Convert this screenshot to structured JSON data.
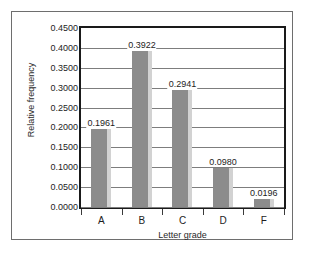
{
  "chart_data": {
    "type": "bar",
    "title": "",
    "xlabel": "Letter grade",
    "ylabel": "Relative frequency",
    "categories": [
      "A",
      "B",
      "C",
      "D",
      "F"
    ],
    "values": [
      0.1961,
      0.3922,
      0.2941,
      0.098,
      0.0196
    ],
    "data_labels": [
      "0.1961",
      "0.3922",
      "0.2941",
      "0.0980",
      "0.0196"
    ],
    "ylim": [
      0.0,
      0.45
    ],
    "ytick_values": [
      0.45,
      0.4,
      0.35,
      0.3,
      0.25,
      0.2,
      0.15,
      0.1,
      0.05,
      0.0
    ],
    "ytick_labels": [
      "0.4500",
      "0.4000",
      "0.3500",
      "0.3000",
      "0.2500",
      "0.2000",
      "0.1500",
      "0.1000",
      "0.0500",
      "0.0000"
    ],
    "grid": true,
    "grid_axis": "y",
    "legend": false,
    "legend_position": "none",
    "colors": {
      "bar_fill": "#8c8c8c",
      "bar_shadow": "#d2d2d2",
      "gridline": "#7d7d7d",
      "axis": "#1a1a1a",
      "text": "#1d1d1d",
      "frame": "#6e6e6e",
      "background": "#ffffff"
    }
  }
}
